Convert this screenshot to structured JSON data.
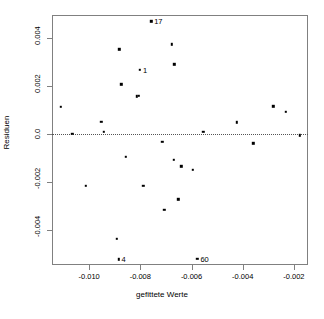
{
  "chart_data": {
    "type": "scatter",
    "title": "",
    "xlabel": "gefittete Werte",
    "ylabel": "Residuen",
    "xlim": [
      -0.01145,
      -0.00145
    ],
    "ylim": [
      -0.00545,
      0.00495
    ],
    "xticks": [
      -0.01,
      -0.008,
      -0.006,
      -0.004,
      -0.002
    ],
    "xticklabels": [
      "-0.010",
      "-0.008",
      "-0.006",
      "-0.004",
      "-0.002"
    ],
    "yticks": [
      0.004,
      0.002,
      0.0,
      -0.002,
      -0.004
    ],
    "yticklabels": [
      "0.004",
      "0.002",
      "0.0",
      "-0.002",
      "-0.004"
    ],
    "grid": false,
    "legend": null,
    "reference_line": {
      "y": 0.0,
      "style": "dotted"
    },
    "points": [
      {
        "x": -0.0111,
        "y": 0.00113
      },
      {
        "x": -0.01065,
        "y": 2e-05
      },
      {
        "x": -0.01013,
        "y": -0.00216
      },
      {
        "x": -0.00953,
        "y": 0.00051
      },
      {
        "x": -0.00942,
        "y": 9e-05
      },
      {
        "x": -0.00893,
        "y": -0.00435
      },
      {
        "x": -0.00885,
        "y": -0.00522
      },
      {
        "x": -0.00882,
        "y": 0.00353
      },
      {
        "x": -0.00875,
        "y": 0.00206
      },
      {
        "x": -0.00857,
        "y": -0.00094
      },
      {
        "x": -0.00813,
        "y": 0.00156
      },
      {
        "x": -0.00806,
        "y": 0.0016
      },
      {
        "x": -0.00801,
        "y": 0.00268
      },
      {
        "x": -0.00788,
        "y": -0.00216
      },
      {
        "x": -0.00757,
        "y": 0.00468
      },
      {
        "x": -0.00714,
        "y": -0.00032
      },
      {
        "x": -0.00706,
        "y": -0.00315
      },
      {
        "x": -0.00676,
        "y": 0.00373
      },
      {
        "x": -0.0067,
        "y": -0.00108
      },
      {
        "x": -0.00667,
        "y": 0.0029
      },
      {
        "x": -0.00651,
        "y": -0.00272
      },
      {
        "x": -0.0064,
        "y": -0.00135
      },
      {
        "x": -0.00596,
        "y": -0.00148
      },
      {
        "x": -0.00577,
        "y": -0.00518
      },
      {
        "x": -0.00554,
        "y": 0.0001
      },
      {
        "x": -0.00424,
        "y": 0.00048
      },
      {
        "x": -0.00359,
        "y": -0.00038
      },
      {
        "x": -0.00281,
        "y": 0.00115
      },
      {
        "x": -0.00232,
        "y": 0.00093
      },
      {
        "x": -0.00178,
        "y": -6e-05
      }
    ],
    "point_labels": [
      {
        "text": "17",
        "x": -0.00757,
        "y": 0.00468
      },
      {
        "text": "1",
        "x": -0.00801,
        "y": 0.00268
      },
      {
        "text": "4",
        "x": -0.00885,
        "y": -0.00522
      },
      {
        "text": "60",
        "x": -0.00577,
        "y": -0.00518
      }
    ]
  }
}
